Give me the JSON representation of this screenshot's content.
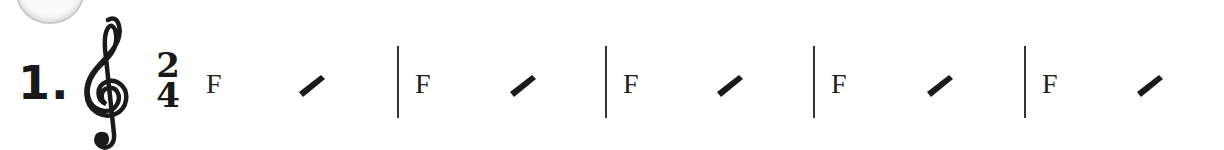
{
  "exercise": {
    "number": "1.",
    "clef": "treble-clef",
    "time_signature": {
      "top": "2",
      "bottom": "4"
    }
  },
  "measures": [
    {
      "chord": "F",
      "beats": [
        "chord",
        "slash"
      ]
    },
    {
      "chord": "F",
      "beats": [
        "chord",
        "slash"
      ]
    },
    {
      "chord": "F",
      "beats": [
        "chord",
        "slash"
      ]
    },
    {
      "chord": "F",
      "beats": [
        "chord",
        "slash"
      ]
    },
    {
      "chord": "F",
      "beats": [
        "chord",
        "slash"
      ]
    }
  ],
  "colors": {
    "ink": "#1a1a1a",
    "badge_border": "#c8c8c8"
  }
}
